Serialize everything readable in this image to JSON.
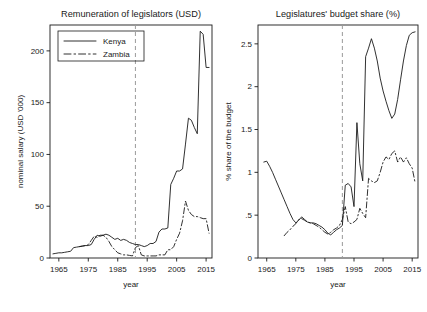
{
  "figure": {
    "width": 427,
    "height": 312,
    "background": "#ffffff",
    "ink": "#1a1a1a",
    "reference_line_color": "#9a9a9a"
  },
  "chart_data": [
    {
      "id": "panel-left",
      "type": "line",
      "title": "Remuneration of legislators (USD)",
      "xlabel": "year",
      "ylabel": "nominal salary (USD '000)",
      "xlim": [
        1962,
        2017
      ],
      "ylim": [
        0,
        225
      ],
      "xticks": [
        1965,
        1975,
        1985,
        1995,
        2005,
        2015
      ],
      "xticklabels": [
        "1965",
        "1975",
        "1985",
        "1995",
        "2005",
        "2015"
      ],
      "yticks": [
        0,
        50,
        100,
        150,
        200
      ],
      "yticklabels": [
        "0",
        "50",
        "100",
        "150",
        "200"
      ],
      "grid": false,
      "legend": {
        "position": "top-left",
        "entries": [
          {
            "label": "Kenya",
            "style": "solid"
          },
          {
            "label": "Zambia",
            "style": "dash-dot"
          }
        ]
      },
      "annotations": [
        {
          "type": "vertical-reference-line",
          "x": 1991,
          "style": "dashed",
          "color": "#9a9a9a"
        }
      ],
      "series": [
        {
          "name": "Kenya",
          "style": "solid",
          "x": [
            1963,
            1964,
            1965,
            1966,
            1967,
            1968,
            1969,
            1970,
            1971,
            1972,
            1973,
            1974,
            1975,
            1976,
            1977,
            1978,
            1979,
            1980,
            1981,
            1982,
            1983,
            1984,
            1985,
            1986,
            1987,
            1988,
            1989,
            1990,
            1991,
            1992,
            1993,
            1994,
            1995,
            1996,
            1997,
            1998,
            1999,
            2000,
            2001,
            2002,
            2003,
            2004,
            2005,
            2006,
            2007,
            2008,
            2009,
            2010,
            2011,
            2012,
            2013,
            2014,
            2015,
            2016
          ],
          "y": [
            4,
            4.5,
            5,
            5,
            5.5,
            6,
            6.5,
            10,
            10.5,
            11,
            11.5,
            12,
            12,
            13,
            18,
            22,
            21,
            22,
            23,
            22,
            20,
            18,
            19,
            17,
            18,
            17,
            15,
            14,
            13,
            13,
            12,
            11,
            12,
            14,
            14,
            16,
            25,
            28,
            28,
            29,
            71,
            77,
            84,
            84,
            86,
            110,
            135,
            133,
            126,
            120,
            219,
            216,
            184,
            184
          ]
        },
        {
          "name": "Zambia",
          "style": "dash-dot",
          "x": [
            1972,
            1973,
            1974,
            1975,
            1976,
            1977,
            1978,
            1979,
            1980,
            1981,
            1982,
            1983,
            1984,
            1985,
            1986,
            1987,
            1988,
            1989,
            1990,
            1991,
            1992,
            1993,
            1994,
            1995,
            1996,
            1997,
            1998,
            1999,
            2000,
            2001,
            2002,
            2003,
            2004,
            2005,
            2006,
            2007,
            2008,
            2009,
            2010,
            2011,
            2012,
            2013,
            2014,
            2015,
            2016
          ],
          "y": [
            11,
            11.5,
            12,
            13,
            17,
            21,
            20,
            22,
            22,
            20,
            16,
            11,
            8,
            5,
            4,
            3,
            3,
            2.5,
            2,
            10,
            12,
            3,
            2,
            2,
            2,
            2,
            2,
            3,
            3,
            3,
            8,
            8,
            11,
            18,
            24,
            36,
            55,
            46,
            42,
            40,
            40,
            39,
            38,
            38,
            24
          ]
        }
      ]
    },
    {
      "id": "panel-right",
      "type": "line",
      "title": "Legislatures' budget share (%)",
      "xlabel": "year",
      "ylabel": "% share of the budget",
      "xlim": [
        1962,
        2017
      ],
      "ylim": [
        0,
        2.72
      ],
      "xticks": [
        1965,
        1975,
        1985,
        1995,
        2005,
        2015
      ],
      "xticklabels": [
        "1965",
        "1975",
        "1985",
        "1995",
        "2005",
        "2015"
      ],
      "yticks": [
        0,
        0.5,
        1,
        1.5,
        2,
        2.5
      ],
      "yticklabels": [
        "0",
        ".5",
        "1",
        "1.5",
        "2",
        "2.5"
      ],
      "grid": false,
      "legend": {
        "position": "none",
        "entries": []
      },
      "annotations": [
        {
          "type": "vertical-reference-line",
          "x": 1991,
          "style": "dashed",
          "color": "#9a9a9a"
        }
      ],
      "series": [
        {
          "name": "Kenya",
          "style": "solid",
          "x": [
            1964,
            1965,
            1966,
            1967,
            1968,
            1969,
            1970,
            1971,
            1972,
            1973,
            1974,
            1975,
            1976,
            1977,
            1978,
            1979,
            1980,
            1981,
            1982,
            1983,
            1984,
            1985,
            1986,
            1987,
            1988,
            1989,
            1990,
            1991,
            1992,
            1993,
            1994,
            1995,
            1996,
            1997,
            1998,
            1999,
            2000,
            2001,
            2002,
            2003,
            2004,
            2005,
            2006,
            2007,
            2008,
            2009,
            2010,
            2011,
            2012,
            2013,
            2014,
            2015,
            2016
          ],
          "y": [
            1.12,
            1.13,
            1.07,
            1.0,
            0.92,
            0.84,
            0.76,
            0.68,
            0.6,
            0.52,
            0.45,
            0.41,
            0.44,
            0.48,
            0.45,
            0.42,
            0.41,
            0.41,
            0.4,
            0.38,
            0.36,
            0.33,
            0.29,
            0.27,
            0.3,
            0.33,
            0.35,
            0.38,
            0.85,
            0.87,
            0.83,
            0.6,
            1.58,
            1.1,
            0.9,
            2.35,
            2.45,
            2.56,
            2.45,
            2.3,
            2.1,
            1.95,
            1.83,
            1.72,
            1.63,
            1.68,
            1.85,
            2.08,
            2.3,
            2.48,
            2.6,
            2.63,
            2.64
          ]
        },
        {
          "name": "Zambia",
          "style": "dash-dot",
          "x": [
            1971,
            1972,
            1973,
            1974,
            1975,
            1976,
            1977,
            1978,
            1979,
            1980,
            1981,
            1982,
            1983,
            1984,
            1985,
            1986,
            1987,
            1988,
            1989,
            1990,
            1991,
            1992,
            1993,
            1994,
            1995,
            1996,
            1997,
            1998,
            1999,
            2000,
            2001,
            2002,
            2003,
            2004,
            2005,
            2006,
            2007,
            2008,
            2009,
            2010,
            2011,
            2012,
            2013,
            2014,
            2015,
            2016
          ],
          "y": [
            0.26,
            0.3,
            0.33,
            0.37,
            0.4,
            0.45,
            0.46,
            0.44,
            0.42,
            0.41,
            0.4,
            0.38,
            0.36,
            0.33,
            0.3,
            0.28,
            0.3,
            0.33,
            0.35,
            0.38,
            0.45,
            0.6,
            0.42,
            0.4,
            0.42,
            0.45,
            0.58,
            0.52,
            0.47,
            0.93,
            0.9,
            0.88,
            0.9,
            1.0,
            1.12,
            1.18,
            1.15,
            1.22,
            1.25,
            1.12,
            1.18,
            1.12,
            1.17,
            1.1,
            1.05,
            0.88
          ]
        }
      ]
    }
  ]
}
